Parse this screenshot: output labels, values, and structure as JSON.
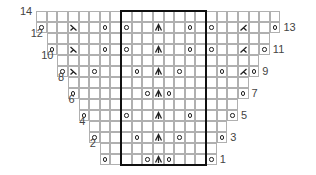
{
  "chart_data": {
    "type": "table",
    "rows": 14,
    "box_columns": [
      8,
      15
    ],
    "legend_symbols": {
      "o": "yarn-over",
      "l": "left-slant-decrease",
      "r": "right-slant-decrease",
      "c": "centered-double-decrease",
      "": "knit"
    },
    "row_labels": [
      {
        "row": 1,
        "label": "1",
        "side": "right"
      },
      {
        "row": 2,
        "label": "2",
        "side": "left"
      },
      {
        "row": 3,
        "label": "3",
        "side": "right"
      },
      {
        "row": 4,
        "label": "4",
        "side": "left"
      },
      {
        "row": 5,
        "label": "5",
        "side": "right"
      },
      {
        "row": 6,
        "label": "6",
        "side": "left"
      },
      {
        "row": 7,
        "label": "7",
        "side": "right"
      },
      {
        "row": 8,
        "label": "8",
        "side": "left"
      },
      {
        "row": 9,
        "label": "9",
        "side": "right"
      },
      {
        "row": 10,
        "label": "10",
        "side": "left"
      },
      {
        "row": 11,
        "label": "11",
        "side": "right"
      },
      {
        "row": 12,
        "label": "12",
        "side": "left"
      },
      {
        "row": 13,
        "label": "13",
        "side": "right"
      },
      {
        "row": 14,
        "label": "14",
        "side": "left"
      }
    ],
    "grid": [
      {
        "row": 1,
        "start": 6,
        "end": 16,
        "symbols": {
          "6": "o",
          "10": "o",
          "11": "c",
          "12": "o",
          "16": "o"
        }
      },
      {
        "row": 2,
        "start": 6,
        "end": 16,
        "symbols": {}
      },
      {
        "row": 3,
        "start": 5,
        "end": 17,
        "symbols": {
          "5": "o",
          "9": "o",
          "11": "c",
          "13": "o",
          "17": "o"
        }
      },
      {
        "row": 4,
        "start": 5,
        "end": 17,
        "symbols": {}
      },
      {
        "row": 5,
        "start": 4,
        "end": 18,
        "symbols": {
          "4": "o",
          "8": "o",
          "11": "c",
          "14": "o",
          "18": "o"
        }
      },
      {
        "row": 6,
        "start": 4,
        "end": 18,
        "symbols": {}
      },
      {
        "row": 7,
        "start": 3,
        "end": 19,
        "symbols": {
          "3": "o",
          "10": "o",
          "11": "c",
          "12": "o",
          "19": "o"
        }
      },
      {
        "row": 8,
        "start": 3,
        "end": 19,
        "symbols": {}
      },
      {
        "row": 9,
        "start": 2,
        "end": 20,
        "symbols": {
          "2": "o",
          "3": "l",
          "5": "o",
          "9": "o",
          "11": "c",
          "13": "o",
          "17": "o",
          "19": "r",
          "20": "o"
        }
      },
      {
        "row": 10,
        "start": 2,
        "end": 20,
        "symbols": {}
      },
      {
        "row": 11,
        "start": 1,
        "end": 21,
        "symbols": {
          "1": "o",
          "3": "l",
          "6": "o",
          "8": "o",
          "11": "c",
          "14": "o",
          "16": "o",
          "19": "r",
          "21": "o"
        }
      },
      {
        "row": 12,
        "start": 1,
        "end": 21,
        "symbols": {}
      },
      {
        "row": 13,
        "start": 0,
        "end": 22,
        "symbols": {
          "0": "o",
          "3": "l",
          "6": "o",
          "8": "o",
          "11": "c",
          "14": "o",
          "16": "o",
          "19": "r",
          "22": "o"
        }
      },
      {
        "row": 14,
        "start": 0,
        "end": 22,
        "symbols": {}
      }
    ]
  },
  "layout": {
    "origin_x": 36,
    "origin_y": 11,
    "cell_w": 10.63,
    "cell_h": 11
  }
}
